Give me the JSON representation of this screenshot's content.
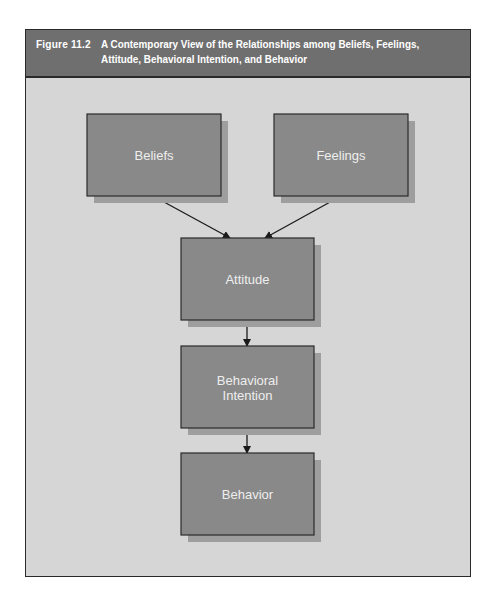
{
  "figure": {
    "number": "Figure 11.2",
    "title": "A Contemporary View of the Relationships among Beliefs, Feelings, Attitude, Behavioral Intention, and Behavior"
  },
  "colors": {
    "header_bg": "#6f6f6f",
    "panel_bg": "#d6d6d6",
    "box_fill": "#898989",
    "box_shadow": "#9e9e9e",
    "border": "#2a2a2a",
    "label": "#eeeeee"
  },
  "nodes": [
    {
      "id": "beliefs",
      "lines": [
        "Beliefs"
      ]
    },
    {
      "id": "feelings",
      "lines": [
        "Feelings"
      ]
    },
    {
      "id": "attitude",
      "lines": [
        "Attitude"
      ]
    },
    {
      "id": "intention",
      "lines": [
        "Behavioral",
        "Intention"
      ]
    },
    {
      "id": "behavior",
      "lines": [
        "Behavior"
      ]
    }
  ],
  "edges": [
    {
      "from": "beliefs",
      "to": "attitude"
    },
    {
      "from": "feelings",
      "to": "attitude"
    },
    {
      "from": "attitude",
      "to": "intention"
    },
    {
      "from": "intention",
      "to": "behavior"
    }
  ]
}
